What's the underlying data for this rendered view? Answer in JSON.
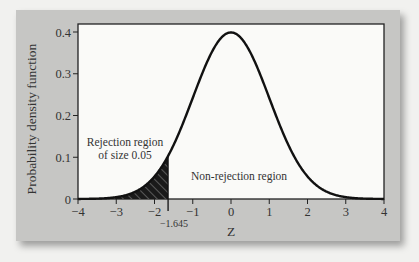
{
  "chart_data": {
    "type": "line",
    "title": "",
    "xlabel": "Z",
    "ylabel": "Probability density function",
    "xlim": [
      -4,
      4
    ],
    "ylim": [
      0,
      0.42
    ],
    "x_ticks": [
      -4,
      -3,
      -2,
      -1,
      0,
      1,
      2,
      3,
      4
    ],
    "x_tick_labels": [
      "−4",
      "−3",
      "−2",
      "−1",
      "0",
      "1",
      "2",
      "3",
      "4"
    ],
    "y_ticks": [
      0,
      0.1,
      0.2,
      0.3,
      0.4
    ],
    "y_tick_labels": [
      "0",
      "0.1",
      "0.2",
      "0.3",
      "0.4"
    ],
    "series": [
      {
        "name": "Standard normal density",
        "x": [
          -4,
          -3.5,
          -3,
          -2.5,
          -2,
          -1.645,
          -1.5,
          -1,
          -0.5,
          0,
          0.5,
          1,
          1.5,
          2,
          2.5,
          3,
          3.5,
          4
        ],
        "y": [
          0.0001,
          0.0009,
          0.0044,
          0.0175,
          0.054,
          0.1031,
          0.1295,
          0.242,
          0.3521,
          0.3989,
          0.3521,
          0.242,
          0.1295,
          0.054,
          0.0175,
          0.0044,
          0.0009,
          0.0001
        ]
      }
    ],
    "critical_value": -1.645,
    "critical_value_label": "−1.645",
    "shaded_region": {
      "from": -4,
      "to": -1.645,
      "style": "hatched",
      "area": 0.05
    },
    "annotations": [
      {
        "text": "Rejection region",
        "line": 1
      },
      {
        "text": "of size 0.05",
        "line": 2
      },
      {
        "text": "Non-rejection region"
      }
    ],
    "grid": false,
    "legend": null
  },
  "labels": {
    "ylabel": "Probability density function",
    "xlabel": "Z",
    "rejection_line1": "Rejection region",
    "rejection_line2": "of size 0.05",
    "non_rejection": "Non-rejection region",
    "critical": "−1.645",
    "xticks": [
      "−4",
      "−3",
      "−2",
      "−1",
      "0",
      "1",
      "2",
      "3",
      "4"
    ],
    "yticks": [
      "0",
      "0.1",
      "0.2",
      "0.3",
      "0.4"
    ]
  }
}
